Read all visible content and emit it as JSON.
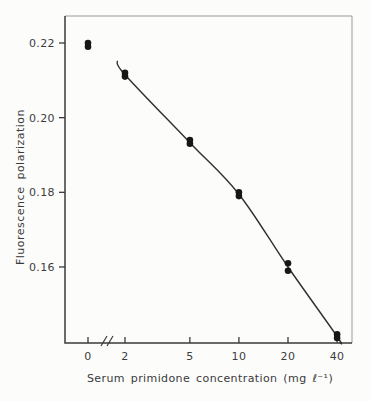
{
  "figure": {
    "background": "#fcfcfb",
    "ink": "#3a3a3a",
    "frame_light": "#9a9a9a",
    "curve_color": "#2f2f2f",
    "point_color": "#161616"
  },
  "chart_data": {
    "type": "scatter",
    "title": "",
    "xlabel": "Serum primidone concentration (mg ℓ⁻¹)",
    "ylabel": "Fluorescence polarization",
    "x_scale": "log, with axis break between 0 and 2",
    "x_ticks": [
      "0",
      "2",
      "5",
      "10",
      "20",
      "40"
    ],
    "y_ticks": [
      0.22,
      0.2,
      0.18,
      0.16
    ],
    "ylim": [
      0.14,
      0.2275
    ],
    "grid": false,
    "legend": false,
    "series": [
      {
        "name": "replicate measurements",
        "marker": "filled-circle",
        "points": [
          {
            "x": 0,
            "y": [
              0.22,
              0.219
            ]
          },
          {
            "x": 2,
            "y": [
              0.212,
              0.211
            ]
          },
          {
            "x": 5,
            "y": [
              0.194,
              0.193
            ]
          },
          {
            "x": 10,
            "y": [
              0.18,
              0.179
            ]
          },
          {
            "x": 20,
            "y": [
              0.161,
              0.159
            ]
          },
          {
            "x": 40,
            "y": [
              0.142,
              0.141
            ]
          }
        ]
      }
    ],
    "fit_curve": {
      "note": "calibration curve drawn through the 2-40 points only; the 0 point is off the curve",
      "points": [
        {
          "x": 1.79,
          "y": 0.2152
        },
        {
          "x": 2,
          "y": 0.2115
        },
        {
          "x": 5,
          "y": 0.1933
        },
        {
          "x": 10,
          "y": 0.1795
        },
        {
          "x": 20,
          "y": 0.16
        },
        {
          "x": 40,
          "y": 0.1414
        },
        {
          "x": 41.5,
          "y": 0.1398
        }
      ]
    }
  }
}
